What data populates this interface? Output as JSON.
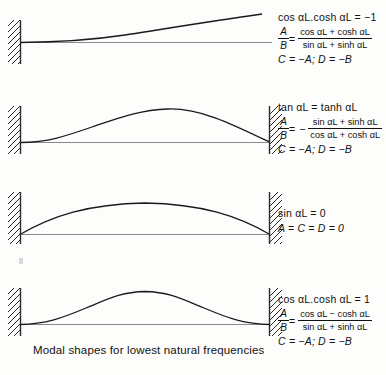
{
  "figure": {
    "caption": "Modal shapes for lowest natural frequencies",
    "background_color": "#fdfdfc",
    "ink_color": "#111111",
    "baseline_color": "#8a8a8a"
  },
  "panels": [
    {
      "id": "panel-1",
      "boundary_conditions": "clamped-free",
      "left_support": "fixed-wall",
      "right_support": "free",
      "mode_description": "cantilever first mode, tip deflects upward",
      "condition": "cos αL.cosh αL = −1",
      "ratio_label_num": "A",
      "ratio_label_den": "B",
      "ratio_sign": "",
      "ratio_num": "cos αL + cosh αL",
      "ratio_den": "sin αL + sinh αL",
      "tail": "C = −A;  D = −B"
    },
    {
      "id": "panel-2",
      "boundary_conditions": "clamped-pinned",
      "left_support": "fixed-wall",
      "right_support": "fixed-wall",
      "mode_description": "single hump skewed toward the right support",
      "condition": "tan αL = tanh αL",
      "ratio_label_num": "A",
      "ratio_label_den": "B",
      "ratio_sign": "−",
      "ratio_num": "sin αL + sinh αL",
      "ratio_den": "cos αL + cosh αL",
      "tail": "C = −A;  D = −B"
    },
    {
      "id": "panel-3",
      "boundary_conditions": "pinned-pinned",
      "left_support": "fixed-wall",
      "right_support": "fixed-wall",
      "mode_description": "symmetric half sine arch",
      "condition": "sin αL = 0",
      "ratio_label_num": "",
      "ratio_label_den": "",
      "ratio_sign": "",
      "ratio_num": "",
      "ratio_den": "",
      "tail": "A = C = D = 0"
    },
    {
      "id": "panel-4",
      "boundary_conditions": "clamped-clamped",
      "left_support": "fixed-wall",
      "right_support": "fixed-wall",
      "mode_description": "symmetric hump with zero slope at both walls",
      "condition": "cos αL.cosh αL = 1",
      "ratio_label_num": "A",
      "ratio_label_den": "B",
      "ratio_sign": "",
      "ratio_num": "cos αL − cosh αL",
      "ratio_den": "sin αL + sinh αL",
      "tail": "C = −A;  D = −B"
    }
  ]
}
